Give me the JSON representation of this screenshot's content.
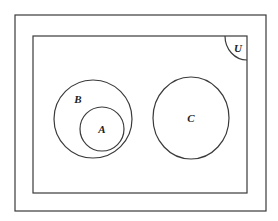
{
  "diagram": {
    "type": "venn",
    "colors": {
      "stroke": "#3a3a3a",
      "text": "#222222",
      "background": "#ffffff"
    },
    "frame": {
      "outer": {
        "x": 15,
        "y": 15,
        "w": 251,
        "h": 196
      }
    },
    "universe": {
      "label": "U",
      "x": 33,
      "y": 36,
      "w": 214,
      "h": 157
    },
    "sets": [
      {
        "label": "B",
        "cx": 93,
        "cy": 119,
        "r": 39,
        "label_x": 78,
        "label_y": 103,
        "contains": [
          "A"
        ]
      },
      {
        "label": "A",
        "cx": 102,
        "cy": 129,
        "r": 22,
        "label_x": 102,
        "label_y": 133,
        "subset_of": "B"
      },
      {
        "label": "C",
        "cx": 191,
        "cy": 118,
        "rx": 38,
        "ry": 41,
        "label_x": 191,
        "label_y": 122,
        "disjoint_from": [
          "A",
          "B"
        ]
      }
    ],
    "relations": [
      "A ⊂ B",
      "B ∩ C = ∅",
      "A ∩ C = ∅"
    ]
  }
}
